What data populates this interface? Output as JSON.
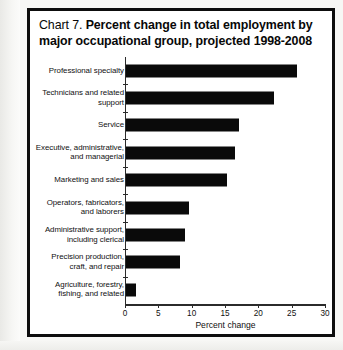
{
  "chart_data": {
    "type": "bar",
    "orientation": "horizontal",
    "title_number": "Chart 7.",
    "title": "Percent change in total employment by major occupational group, projected 1998-2008",
    "title_line1": "Percent change in total employment by",
    "title_line2": "major occupational group, projected 1998-2008",
    "xlabel": "Percent change",
    "ylabel": "",
    "xlim": [
      0,
      30
    ],
    "xticks": [
      0,
      5,
      10,
      15,
      20,
      25,
      30
    ],
    "xtick_labels": [
      "0",
      "5",
      "10",
      "15",
      "20",
      "25",
      "30"
    ],
    "grid": false,
    "legend": false,
    "bar_color": "#0a0a0a",
    "categories": [
      "Professional specialty",
      "Technicians and related\nsupport",
      "Service",
      "Executive, administrative,\nand managerial",
      "Marketing and sales",
      "Operators, fabricators,\nand laborers",
      "Administrative support,\nincluding clerical",
      "Precision production,\ncraft, and repair",
      "Agriculture, forestry,\nfishing, and related"
    ],
    "values": [
      25.6,
      22.2,
      16.9,
      16.4,
      15.2,
      9.5,
      8.9,
      8.1,
      1.5
    ]
  },
  "chart": {
    "title_number": "Chart 7.",
    "title_line1": "Percent change in total employment by",
    "title_line2": "major occupational group, projected 1998-2008",
    "xaxis_title": "Percent change",
    "rows": [
      {
        "label": "Professional specialty",
        "value": 25.6
      },
      {
        "label": "Technicians and related\nsupport",
        "value": 22.2
      },
      {
        "label": "Service",
        "value": 16.9
      },
      {
        "label": "Executive, administrative,\nand managerial",
        "value": 16.4
      },
      {
        "label": "Marketing and sales",
        "value": 15.2
      },
      {
        "label": "Operators, fabricators,\nand laborers",
        "value": 9.5
      },
      {
        "label": "Administrative support,\nincluding clerical",
        "value": 8.9
      },
      {
        "label": "Precision production,\ncraft, and repair",
        "value": 8.1
      },
      {
        "label": "Agriculture, forestry,\nfishing, and related",
        "value": 1.5
      }
    ],
    "xticks": [
      "0",
      "5",
      "10",
      "15",
      "20",
      "25",
      "30"
    ]
  }
}
